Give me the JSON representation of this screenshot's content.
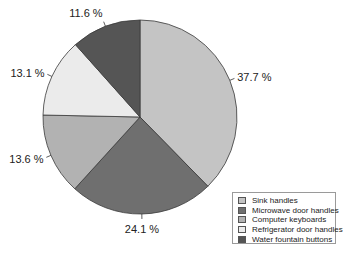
{
  "chart_data": {
    "type": "pie",
    "title": "",
    "start_angle_deg": 0,
    "direction": "clockwise",
    "categories": [
      "Sink handles",
      "Microwave door handles",
      "Computer keyboards",
      "Refrigerator door handles",
      "Water fountain buttons"
    ],
    "values": [
      37.7,
      24.1,
      13.6,
      13.1,
      11.6
    ],
    "labels": [
      "37.7 %",
      "24.1 %",
      "13.6 %",
      "13.1 %",
      "11.6 %"
    ],
    "colors": [
      "#c4c4c4",
      "#6f6f6f",
      "#b2b2b2",
      "#ebebeb",
      "#555555"
    ],
    "legend_position": "bottom-right"
  },
  "legend": {
    "items": [
      {
        "label": "Sink handles",
        "color": "#c4c4c4"
      },
      {
        "label": "Microwave door handles",
        "color": "#6f6f6f"
      },
      {
        "label": "Computer keyboards",
        "color": "#b2b2b2"
      },
      {
        "label": "Refrigerator door handles",
        "color": "#ebebeb"
      },
      {
        "label": "Water fountain buttons",
        "color": "#555555"
      }
    ]
  }
}
